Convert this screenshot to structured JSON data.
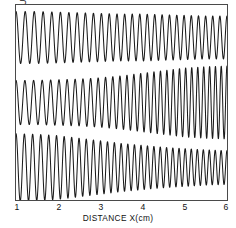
{
  "figure": {
    "ylabel": "INTERFEROMETER OUTPUT",
    "xlabel": "DISTANCE   X(cm)",
    "background_color": "#ffffff",
    "trace_color": "#1a1a1a",
    "frame_color": "#4a4a4a"
  },
  "chart_data": {
    "type": "line",
    "title": "",
    "xlabel": "DISTANCE   X(cm)",
    "ylabel": "INTERFEROMETER OUTPUT",
    "xlim": [
      1,
      6
    ],
    "ylim": [
      0,
      3
    ],
    "grid": false,
    "legend": "none",
    "xticks": [
      1,
      2,
      3,
      4,
      5,
      6
    ],
    "xticklabels": [
      "1",
      "2",
      "3",
      "4",
      "5",
      "6"
    ],
    "yticks": [],
    "yticklabels": [],
    "series": [
      {
        "name": "trace-top",
        "baseline": 2.5,
        "cycles": 27,
        "amplitude_start": 0.4,
        "amplitude_end": 0.33,
        "chirp": 1.18,
        "x": [
          1.0,
          1.5,
          2.0,
          2.5,
          3.0,
          3.5,
          4.0,
          4.5,
          5.0,
          5.5,
          6.0
        ],
        "envelope": [
          0.4,
          0.4,
          0.39,
          0.38,
          0.37,
          0.36,
          0.36,
          0.35,
          0.34,
          0.33,
          0.33
        ],
        "local_frequency": [
          4.6,
          4.8,
          5.0,
          5.2,
          5.4,
          5.6,
          5.7,
          5.8,
          5.9,
          6.0,
          6.0
        ]
      },
      {
        "name": "trace-middle",
        "baseline": 1.5,
        "cycles": 30,
        "amplitude_start": 0.34,
        "amplitude_end": 0.56,
        "chirp": 1.45,
        "x": [
          1.0,
          1.5,
          2.0,
          2.5,
          3.0,
          3.5,
          4.0,
          4.5,
          5.0,
          5.5,
          6.0
        ],
        "envelope": [
          0.34,
          0.34,
          0.35,
          0.36,
          0.38,
          0.41,
          0.45,
          0.49,
          0.53,
          0.55,
          0.56
        ],
        "local_frequency": [
          4.8,
          5.0,
          5.2,
          5.5,
          5.8,
          6.1,
          6.4,
          6.7,
          7.0,
          7.3,
          7.5
        ]
      },
      {
        "name": "trace-bottom",
        "baseline": 0.5,
        "cycles": 31,
        "amplitude_start": 0.52,
        "amplitude_end": 0.26,
        "chirp": 1.3,
        "x": [
          1.0,
          1.5,
          2.0,
          2.5,
          3.0,
          3.5,
          4.0,
          4.5,
          5.0,
          5.5,
          6.0
        ],
        "envelope": [
          0.52,
          0.51,
          0.49,
          0.45,
          0.41,
          0.37,
          0.34,
          0.31,
          0.29,
          0.27,
          0.26
        ],
        "local_frequency": [
          5.0,
          5.2,
          5.5,
          5.8,
          6.0,
          6.3,
          6.5,
          6.7,
          6.9,
          7.1,
          7.2
        ]
      }
    ]
  }
}
